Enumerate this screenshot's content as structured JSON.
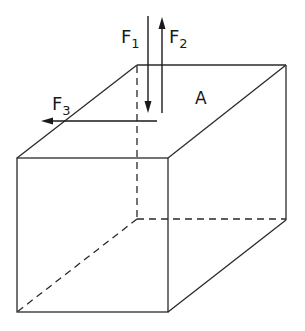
{
  "diagram": {
    "type": "box with forces",
    "labels": {
      "f1": "F",
      "f1_sub": "1",
      "f2": "F",
      "f2_sub": "2",
      "f3": "F",
      "f3_sub": "3",
      "face": "A"
    },
    "forces": [
      {
        "name": "F1",
        "direction": "down",
        "position": "top face near back-left edge"
      },
      {
        "name": "F2",
        "direction": "up",
        "position": "top face near back-left edge"
      },
      {
        "name": "F3",
        "direction": "left",
        "position": "across top face toward front-left"
      }
    ],
    "face_label": "A (top face)",
    "colors": {
      "line": "#2a2a2a",
      "background": "#ffffff"
    }
  }
}
